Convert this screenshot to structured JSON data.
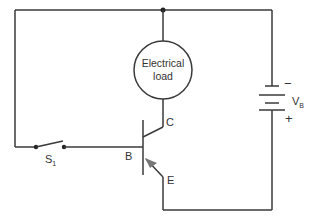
{
  "diagram": {
    "type": "transistor switch circuit",
    "load": {
      "line1": "Electrical",
      "line2": "load"
    },
    "battery": {
      "label": "V",
      "subscript": "B",
      "negative": "−",
      "positive": "+"
    },
    "switch": {
      "label": "S",
      "subscript": "1"
    },
    "transistor": {
      "base": "B",
      "collector": "C",
      "emitter": "E"
    },
    "colors": {
      "wire": "#3a3a3a",
      "arrow": "#777777",
      "text": "#333333",
      "background": "#ffffff"
    }
  }
}
